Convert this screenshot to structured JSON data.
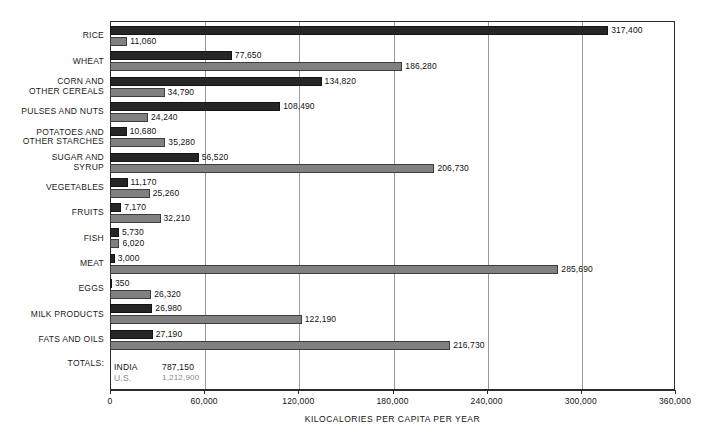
{
  "chart_data": {
    "type": "bar",
    "orientation": "horizontal",
    "title": "",
    "xlabel": "KILOCALORIES PER CAPITA PER YEAR",
    "ylabel": "",
    "xlim": [
      0,
      360000
    ],
    "xticks": [
      0,
      60000,
      120000,
      180000,
      240000,
      300000,
      360000
    ],
    "xtick_labels": [
      "0",
      "60,000",
      "120,000",
      "180,000",
      "240,000",
      "300,000",
      "360,000"
    ],
    "grid": "vertical",
    "legend_position": "inside-bottom-left",
    "categories": [
      "RICE",
      "WHEAT",
      "CORN AND\nOTHER CEREALS",
      "PULSES AND NUTS",
      "POTATOES AND\nOTHER STARCHES",
      "SUGAR AND\nSYRUP",
      "VEGETABLES",
      "FRUITS",
      "FISH",
      "MEAT",
      "EGGS",
      "MILK PRODUCTS",
      "FATS AND OILS"
    ],
    "series": [
      {
        "name": "INDIA",
        "color": "#262626",
        "values": [
          317400,
          77650,
          134820,
          108490,
          10680,
          56520,
          11170,
          7170,
          5730,
          3000,
          350,
          26980,
          27190
        ],
        "value_labels": [
          "317,400",
          "77,650",
          "134,820",
          "108,490",
          "10,680",
          "56,520",
          "11,170",
          "7,170",
          "5,730",
          "3,000",
          "350",
          "26,980",
          "27,190"
        ],
        "total": 787150,
        "total_label": "787,150"
      },
      {
        "name": "U.S.",
        "color": "#808080",
        "values": [
          11060,
          186280,
          34790,
          24240,
          35280,
          206730,
          25260,
          32210,
          6020,
          285690,
          26320,
          122190,
          216730
        ],
        "value_labels": [
          "11,060",
          "186,280",
          "34,790",
          "24,240",
          "35,280",
          "206,730",
          "25,260",
          "32,210",
          "6,020",
          "285,690",
          "26,320",
          "122,190",
          "216,730"
        ],
        "total": 1212900,
        "total_label": "1,212,900"
      }
    ],
    "totals_row_label": "TOTALS:"
  },
  "axis": {
    "title": "KILOCALORIES PER CAPITA PER YEAR",
    "ticks": [
      "0",
      "60,000",
      "120,000",
      "180,000",
      "240,000",
      "300,000",
      "360,000"
    ]
  },
  "legend": {
    "row_label": "TOTALS:",
    "india_key": "INDIA",
    "india_total": "787,150",
    "us_key": "U.S.",
    "us_total": "1,212,900"
  },
  "colors": {
    "india_bar": "#262626",
    "us_bar": "#808080",
    "frame": "#2b2b2b",
    "gridline": "#9a9a9a",
    "background": "#ffffff"
  }
}
